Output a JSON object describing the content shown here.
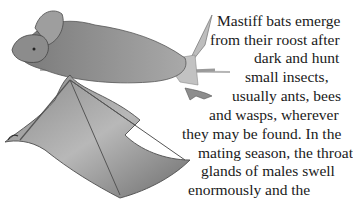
{
  "illustration": {
    "subject": "mastiff bat, pencil drawing, wings spread, perched on branch"
  },
  "passage": {
    "lines": [
      "Mastiff bats emerge",
      "from their roost after",
      "dark and hunt",
      "small insects,",
      "usually ants, bees",
      "and wasps, wherever",
      "they may be found. In the",
      "mating season, the throat",
      "glands of males swell",
      "enormously and the"
    ]
  }
}
